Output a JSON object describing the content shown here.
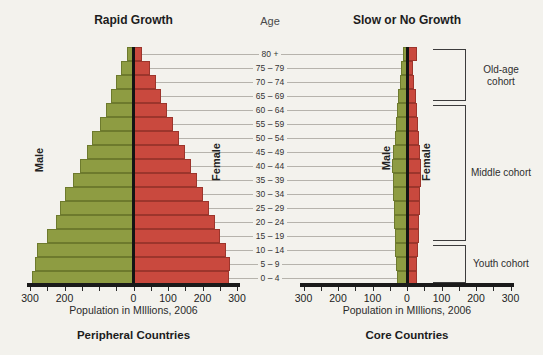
{
  "figure": {
    "background": "#f3f2ed",
    "age_axis": {
      "header": "Age",
      "labels": [
        "80 +",
        "75 – 79",
        "70 – 74",
        "65 – 69",
        "60 – 64",
        "55 – 59",
        "50 – 54",
        "45 – 49",
        "40 – 44",
        "35 – 39",
        "30 – 34",
        "25 – 29",
        "20 – 24",
        "15 – 19",
        "10 – 14",
        "5 – 9",
        "0 – 4"
      ]
    }
  },
  "chart_data": [
    {
      "type": "bar",
      "subtype": "population-pyramid",
      "title": "Rapid Growth",
      "caption": "Peripheral Countries",
      "xlabel": "Population in MIllions, 2006",
      "male_label": "Male",
      "female_label": "Female",
      "gridlines_half": "right",
      "series": [
        {
          "name": "Male",
          "color": "#8e9c42",
          "border": "#6d7a2d",
          "values": [
            20,
            37,
            52,
            65,
            80,
            97,
            120,
            136,
            156,
            176,
            200,
            212,
            226,
            250,
            280,
            285,
            293
          ]
        },
        {
          "name": "Female",
          "color": "#c9493e",
          "border": "#9c352c",
          "values": [
            26,
            47,
            64,
            81,
            98,
            115,
            132,
            150,
            167,
            184,
            201,
            218,
            235,
            252,
            268,
            280,
            278
          ]
        }
      ],
      "x_axis": {
        "unit": "millions of people",
        "range": [
          -300,
          300
        ],
        "minor_tick_step": 50,
        "labels": [
          {
            "value": -300,
            "text": "300"
          },
          {
            "value": -200,
            "text": "200"
          },
          {
            "value": -100,
            "text": ""
          },
          {
            "value": 0,
            "text": "0"
          },
          {
            "value": 100,
            "text": "100"
          },
          {
            "value": 200,
            "text": "200"
          },
          {
            "value": 300,
            "text": "300"
          }
        ]
      }
    },
    {
      "type": "bar",
      "subtype": "population-pyramid",
      "title": "Slow or No Growth",
      "caption": "Core Countries",
      "xlabel": "Population in MIllions, 2006",
      "male_label": "Male",
      "female_label": "Female",
      "gridlines_half": "left",
      "series": [
        {
          "name": "Male",
          "color": "#8e9c42",
          "border": "#6d7a2d",
          "values": [
            12,
            17,
            21,
            25,
            29,
            33,
            36,
            40,
            43,
            42,
            40,
            38,
            38,
            36,
            34,
            31,
            30
          ]
        },
        {
          "name": "Female",
          "color": "#c9493e",
          "border": "#9c352c",
          "values": [
            29,
            17,
            21,
            25,
            29,
            33,
            36,
            39,
            41,
            40,
            39,
            37,
            36,
            34,
            31,
            29,
            28
          ]
        }
      ],
      "x_axis": {
        "unit": "millions of people",
        "range": [
          -300,
          300
        ],
        "minor_tick_step": 50,
        "labels": [
          {
            "value": -300,
            "text": "300"
          },
          {
            "value": -200,
            "text": "200"
          },
          {
            "value": -100,
            "text": "100"
          },
          {
            "value": 0,
            "text": "0"
          },
          {
            "value": 100,
            "text": "100"
          },
          {
            "value": 200,
            "text": "200"
          },
          {
            "value": 300,
            "text": "300"
          }
        ]
      },
      "cohort_brackets": [
        {
          "label": "Old-age cohort",
          "rows": [
            0,
            3
          ]
        },
        {
          "label": "Middle cohort",
          "rows": [
            4,
            13
          ]
        },
        {
          "label": "Youth cohort",
          "rows": [
            14,
            16
          ]
        }
      ]
    }
  ]
}
